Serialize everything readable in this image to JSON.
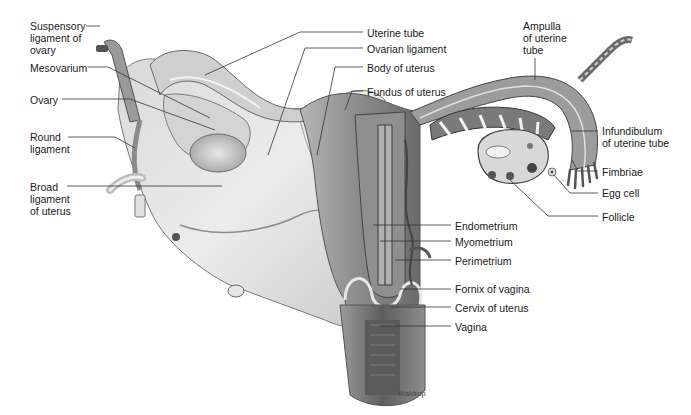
{
  "diagram": {
    "credit": "Waldrop",
    "left_labels": [
      {
        "id": "suspensory-ligament",
        "text": "Suspensory\nligament of\novary",
        "x": 30,
        "y": 20
      },
      {
        "id": "mesovarium",
        "text": "Mesovarium",
        "x": 30,
        "y": 62
      },
      {
        "id": "ovary",
        "text": "Ovary",
        "x": 30,
        "y": 94
      },
      {
        "id": "round-ligament",
        "text": "Round\nligament",
        "x": 30,
        "y": 131
      },
      {
        "id": "broad-ligament",
        "text": "Broad\nligament\nof uterus",
        "x": 30,
        "y": 181
      }
    ],
    "top_labels": [
      {
        "id": "uterine-tube",
        "text": "Uterine tube",
        "x": 367,
        "y": 27
      },
      {
        "id": "ovarian-ligament",
        "text": "Ovarian ligament",
        "x": 367,
        "y": 43
      },
      {
        "id": "body-of-uterus",
        "text": "Body of uterus",
        "x": 367,
        "y": 62
      },
      {
        "id": "fundus-of-uterus",
        "text": "Fundus of uterus",
        "x": 367,
        "y": 86
      }
    ],
    "right_labels": [
      {
        "id": "ampulla",
        "text": "Ampulla\nof uterine\ntube",
        "x": 523,
        "y": 20
      },
      {
        "id": "infundibulum",
        "text": "Infundibulum\nof uterine tube",
        "x": 602,
        "y": 125
      },
      {
        "id": "fimbriae",
        "text": "Fimbriae",
        "x": 602,
        "y": 166
      },
      {
        "id": "egg-cell",
        "text": "Egg cell",
        "x": 602,
        "y": 187
      },
      {
        "id": "follicle",
        "text": "Follicle",
        "x": 602,
        "y": 211
      }
    ],
    "center_labels": [
      {
        "id": "endometrium",
        "text": "Endometrium",
        "x": 455,
        "y": 220
      },
      {
        "id": "myometrium",
        "text": "Myometrium",
        "x": 455,
        "y": 236
      },
      {
        "id": "perimetrium",
        "text": "Perimetrium",
        "x": 455,
        "y": 255
      },
      {
        "id": "fornix-of-vagina",
        "text": "Fornix of vagina",
        "x": 455,
        "y": 283
      },
      {
        "id": "cervix-of-uterus",
        "text": "Cervix of uterus",
        "x": 455,
        "y": 302
      },
      {
        "id": "vagina",
        "text": "Vagina",
        "x": 455,
        "y": 321
      }
    ],
    "colors": {
      "ink": "#1a1a1a",
      "tissue_light": "#e4e4e4",
      "tissue_mid": "#b8b8b8",
      "tissue_dark": "#6e6e6e",
      "leader": "#333333"
    }
  }
}
